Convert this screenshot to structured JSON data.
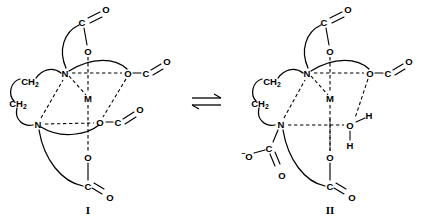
{
  "figure": {
    "type": "chemical-structure-equilibrium",
    "equilibrium_symbol": "⇌",
    "labels": {
      "left": "I",
      "right": "II"
    }
  },
  "atoms": {
    "nitrogen": "N",
    "metal": "M",
    "oxygen": "O",
    "carbon": "C",
    "hydrogen": "H",
    "methylene": "CH",
    "methylene_subscript": "2",
    "charge_minus": "−"
  },
  "structure_I": {
    "label": "I",
    "donor_count": 6,
    "nitrogens": [
      {
        "id": "N-upper",
        "label": "N"
      },
      {
        "id": "N-lower",
        "label": "N"
      }
    ],
    "metal_center": {
      "id": "M",
      "label": "M"
    },
    "ethylene_bridge": [
      {
        "id": "CH2-upper",
        "label": "CH",
        "subscript": "2"
      },
      {
        "id": "CH2-lower",
        "label": "CH",
        "subscript": "2"
      }
    ],
    "carboxylate_arms": [
      {
        "id": "arm-top",
        "coordinating_oxygen": "O",
        "carbonyl_carbon": "C",
        "carbonyl_oxygen": "O",
        "coordinated": true
      },
      {
        "id": "arm-right",
        "coordinating_oxygen": "O",
        "carbonyl_carbon": "C",
        "carbonyl_oxygen": "O",
        "coordinated": true
      },
      {
        "id": "arm-middle-right",
        "coordinating_oxygen": "O",
        "carbonyl_carbon": "C",
        "carbonyl_oxygen": "O",
        "coordinated": true
      },
      {
        "id": "arm-bottom",
        "coordinating_oxygen": "O",
        "carbonyl_carbon": "C",
        "carbonyl_oxygen": "O",
        "coordinated": true
      }
    ]
  },
  "structure_II": {
    "label": "II",
    "donor_count": 5,
    "nitrogens": [
      {
        "id": "N-upper",
        "label": "N"
      },
      {
        "id": "N-lower",
        "label": "N"
      }
    ],
    "metal_center": {
      "id": "M",
      "label": "M"
    },
    "ethylene_bridge": [
      {
        "id": "CH2-upper",
        "label": "CH",
        "subscript": "2"
      },
      {
        "id": "CH2-lower",
        "label": "CH",
        "subscript": "2"
      }
    ],
    "water_ligand": {
      "id": "coordinated-water",
      "oxygen": "O",
      "hydrogens": [
        "H",
        "H"
      ]
    },
    "carboxylate_arms": [
      {
        "id": "arm-top",
        "coordinating_oxygen": "O",
        "carbonyl_carbon": "C",
        "carbonyl_oxygen": "O",
        "coordinated": true
      },
      {
        "id": "arm-right",
        "coordinating_oxygen": "O",
        "carbonyl_carbon": "C",
        "carbonyl_oxygen": "O",
        "coordinated": true
      },
      {
        "id": "arm-bottom",
        "coordinating_oxygen": "O",
        "carbonyl_carbon": "C",
        "carbonyl_oxygen": "O",
        "coordinated": true
      },
      {
        "id": "arm-free-left",
        "charge": "−",
        "terminal_oxygen": "O",
        "carbonyl_carbon": "C",
        "carbonyl_oxygen": "O",
        "coordinated": false
      }
    ]
  }
}
